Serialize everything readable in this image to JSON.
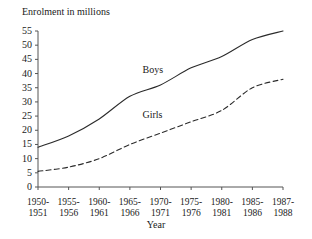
{
  "chart_data": {
    "type": "line",
    "title": "Enrolment in millions",
    "xlabel": "Year",
    "ylabel": "Enrolment in millions",
    "ylim": [
      0,
      55
    ],
    "yticks": [
      0,
      5,
      10,
      15,
      20,
      25,
      30,
      35,
      40,
      45,
      50,
      55
    ],
    "grid": false,
    "legend_position": "inline-annotations",
    "categories": [
      "1950-1951",
      "1955-1956",
      "1960-1961",
      "1965-1966",
      "1970-1971",
      "1975-1976",
      "1980-1981",
      "1985-1986",
      "1987-1988"
    ],
    "series": [
      {
        "name": "Boys",
        "style": "solid",
        "color": "#2b2b2b",
        "values": [
          14,
          18,
          24,
          32,
          36,
          42,
          46,
          52,
          55
        ]
      },
      {
        "name": "Girls",
        "style": "dashed",
        "color": "#2b2b2b",
        "values": [
          5.5,
          7,
          10,
          15,
          19,
          23,
          27,
          35,
          38
        ]
      }
    ],
    "annotations": [
      {
        "text": "Boys",
        "x": "1970-1971",
        "y": 41
      },
      {
        "text": "Girls",
        "x": "1970-1971",
        "y": 25
      }
    ]
  }
}
